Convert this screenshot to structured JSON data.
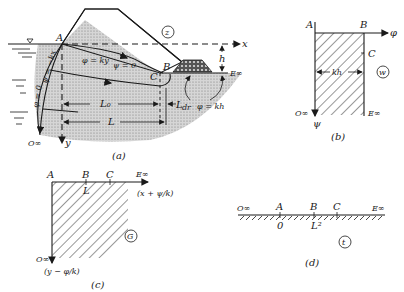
{
  "panel_a": {
    "caption": "(a)",
    "region_symbol": "z",
    "points": {
      "A": "A",
      "B": "B",
      "C": "C",
      "O_inf": "O∞",
      "E_inf": "E∞"
    },
    "axes": {
      "x": "x",
      "y": "y"
    },
    "labels": {
      "phi_ky": "φ = ky",
      "psi_0": "ψ = 0",
      "phi_neg_kx": "ψ = −kx",
      "phi_0": "φ = 0",
      "phi_kh": "φ = kh",
      "h": "h",
      "L0": "L₀",
      "Ldr": "L",
      "Ldr_sub": "dr",
      "L": "L"
    }
  },
  "panel_b": {
    "caption": "(b)",
    "region_symbol": "w",
    "points": {
      "A": "A",
      "B": "B",
      "C": "C",
      "O_inf": "O∞",
      "E_inf": "E∞"
    },
    "axes": {
      "phi": "φ",
      "psi": "ψ"
    },
    "labels": {
      "kh": "kh"
    }
  },
  "panel_c": {
    "caption": "(c)",
    "region_symbol": "G",
    "points": {
      "A": "A",
      "B": "B",
      "C": "C",
      "E_inf": "E∞",
      "O_inf": "O∞"
    },
    "labels": {
      "L": "L"
    },
    "axes": {
      "horizontal": "(x + ψ/k)",
      "vertical": "(y − φ/k)"
    }
  },
  "panel_d": {
    "caption": "(d)",
    "region_symbol": "t",
    "points": {
      "O_inf": "O∞",
      "A": "A",
      "B": "B",
      "C": "C",
      "E_inf": "E∞"
    },
    "values": {
      "A": "0",
      "B": "L²"
    }
  }
}
